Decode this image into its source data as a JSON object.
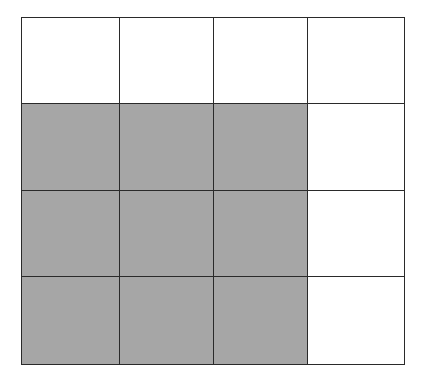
{
  "diagram": {
    "type": "grid",
    "rows": 4,
    "cols": 4,
    "col_edges": [
      0,
      98,
      192,
      286,
      383
    ],
    "row_edges": [
      0,
      86,
      173,
      259,
      347
    ],
    "shaded_color": "#a6a6a6",
    "empty_color": "#ffffff",
    "line_color": "#2a2a2a",
    "cells": [
      [
        0,
        0,
        0,
        0
      ],
      [
        1,
        1,
        1,
        0
      ],
      [
        1,
        1,
        1,
        0
      ],
      [
        1,
        1,
        1,
        0
      ]
    ],
    "shaded_count": 9,
    "total_count": 16
  }
}
